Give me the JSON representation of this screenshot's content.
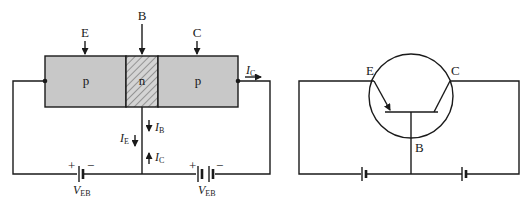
{
  "left_diagram": {
    "terminals": {
      "emitter": "E",
      "base": "B",
      "collector": "C"
    },
    "regions": [
      {
        "label": "p",
        "type": "emitter"
      },
      {
        "label": "n",
        "type": "base"
      },
      {
        "label": "p",
        "type": "collector"
      }
    ],
    "currents": {
      "ic_right": {
        "sym": "I",
        "sub": "C"
      },
      "ie": {
        "sym": "I",
        "sub": "E"
      },
      "ib": {
        "sym": "I",
        "sub": "B"
      },
      "ic_base": {
        "sym": "I",
        "sub": "C"
      }
    },
    "batteries": [
      {
        "plus": "+",
        "minus": "−",
        "sym": "V",
        "sub": "EB"
      },
      {
        "plus": "+",
        "minus": "−",
        "sym": "V",
        "sub": "EB"
      }
    ]
  },
  "right_diagram": {
    "terminals": {
      "emitter": "E",
      "base": "B",
      "collector": "C"
    }
  },
  "colors": {
    "region_fill": "#c8c8c8",
    "line": "#1a1a1a"
  }
}
